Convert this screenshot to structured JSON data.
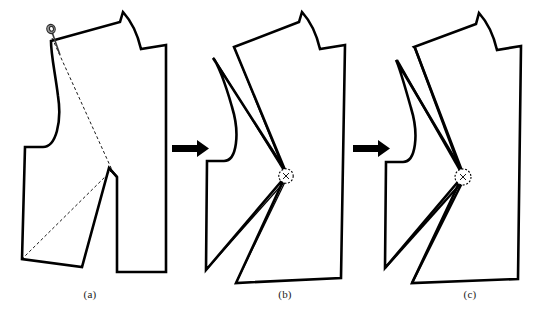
{
  "figure": {
    "background_color": "#ffffff",
    "line_color": "#000000",
    "width": 534,
    "height": 324
  },
  "captions": [
    {
      "id": "a",
      "label": "(a)"
    },
    {
      "id": "b",
      "label": "(b)"
    },
    {
      "id": "c",
      "label": "(c)"
    }
  ],
  "arrows": [
    {
      "id": "arrow-1",
      "from": "a",
      "to": "b",
      "direction": "right"
    },
    {
      "id": "arrow-2",
      "from": "b",
      "to": "c",
      "direction": "right"
    }
  ],
  "markers": {
    "pin": {
      "id": "shoulder-pin",
      "panel": "a",
      "style": "pin-head-and-shaft"
    },
    "pivot_b": {
      "id": "pivot-point-b",
      "panel": "b",
      "style": "dashed-circle",
      "inner_label": "x"
    },
    "pivot_c": {
      "id": "pivot-point-c",
      "panel": "c",
      "style": "dashed-circle",
      "inner_label": "x"
    }
  },
  "panels": [
    {
      "id": "a",
      "name": "bodice-front-with-dashed-dart-lines",
      "dart_line_style": "dashed",
      "notes": "Original pattern piece with pin at shoulder and dashed slash lines to bust point"
    },
    {
      "id": "b",
      "name": "bodice-front-dart-partially-pivoted",
      "dart_line_style": "solid-thin",
      "notes": "Pattern rotated about pivot, shoulder dart opening"
    },
    {
      "id": "c",
      "name": "bodice-front-dart-fully-pivoted",
      "dart_line_style": "solid-heavy",
      "notes": "Pattern fully pivoted, dart legs closed to final position"
    }
  ]
}
